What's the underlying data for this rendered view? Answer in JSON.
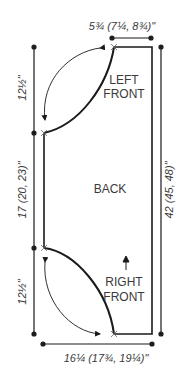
{
  "diagram": {
    "type": "knitting-schematic",
    "colors": {
      "line": "#1a1a1a",
      "text": "#3a3a3a",
      "background": "#ffffff"
    },
    "pieces": {
      "left_front": {
        "line1": "LEFT",
        "line2": "FRONT"
      },
      "back": {
        "label": "BACK"
      },
      "right_front": {
        "line1": "RIGHT",
        "line2": "FRONT"
      }
    },
    "dimensions": {
      "top_width": "5¾ (7¼, 8¾)\"",
      "left_upper": "12½\"",
      "left_middle": "17 (20, 23)\"",
      "left_lower": "12½\"",
      "right_total": "42 (45, 48)\"",
      "bottom_width": "16¼ (17¾, 19¼)\""
    },
    "markers": {
      "direction_arrow": "up-arrow",
      "fold_arrows": [
        "curved-double-arrow-top",
        "curved-double-arrow-bottom"
      ]
    }
  }
}
